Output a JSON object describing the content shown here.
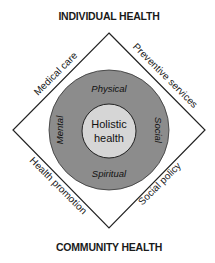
{
  "diagram": {
    "top_label": "INDIVIDUAL HEALTH",
    "bottom_label": "COMMUNITY HEALTH",
    "edges": {
      "top_left": "Medical care",
      "top_right": "Preventive services",
      "bottom_left": "Health promotion",
      "bottom_right": "Social policy"
    },
    "ring": {
      "top": "Physical",
      "right": "Social",
      "bottom": "Spiritual",
      "left": "Mental"
    },
    "core": {
      "line1": "Holistic",
      "line2": "health"
    },
    "colors": {
      "outer_ring": "#8c8c8c",
      "inner_circle": "#d6d6d6",
      "stroke": "#222222",
      "background": "#ffffff"
    }
  }
}
